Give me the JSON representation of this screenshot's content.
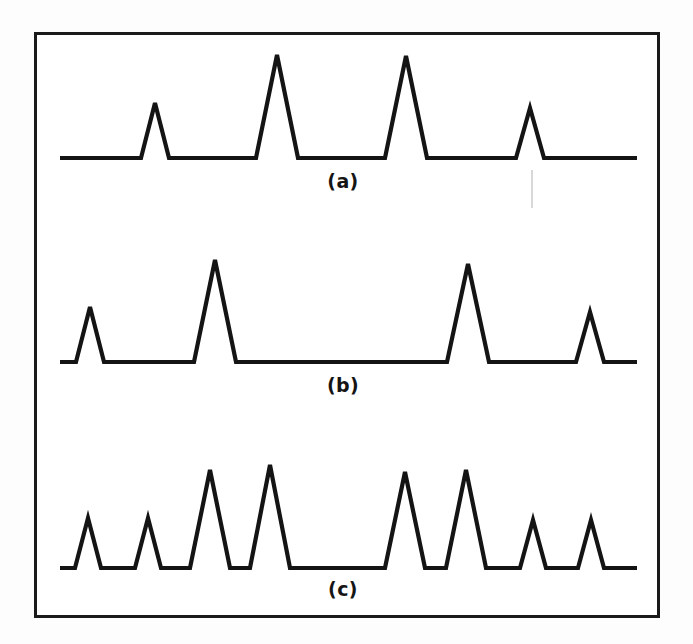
{
  "figure": {
    "title": "",
    "frame": {
      "x": 34,
      "y": 32,
      "width": 626,
      "height": 586,
      "border_color": "#1a1a1a",
      "border_width": 3
    },
    "background_color": "#ffffff",
    "stroke_color": "#141414",
    "stroke_width": 4.2
  },
  "chart_data": {
    "type": "line",
    "title": "",
    "subtitle": "",
    "xlabel": "",
    "ylabel": "",
    "grid": false,
    "legend_position": "none",
    "axes_visible": false,
    "xlim": [
      60,
      637
    ],
    "panels": [
      {
        "id": "a",
        "label": "(a)",
        "label_x": 343,
        "label_y": 170,
        "baseline_y": 158,
        "x_start": 60,
        "x_end": 637,
        "peaks": [
          {
            "index": 1,
            "center": 155,
            "apex_y": 103,
            "half_width": 14,
            "height": 55,
            "relative_height": 0.53
          },
          {
            "index": 2,
            "center": 277,
            "apex_y": 55,
            "half_width": 21,
            "height": 103,
            "relative_height": 1.0
          },
          {
            "index": 3,
            "center": 406,
            "apex_y": 56,
            "half_width": 21,
            "height": 102,
            "relative_height": 0.99
          },
          {
            "index": 4,
            "center": 530,
            "apex_y": 108,
            "half_width": 14,
            "height": 50,
            "relative_height": 0.49
          }
        ]
      },
      {
        "id": "b",
        "label": "(b)",
        "label_x": 343,
        "label_y": 374,
        "baseline_y": 362,
        "x_start": 60,
        "x_end": 637,
        "peaks": [
          {
            "index": 1,
            "center": 90,
            "apex_y": 307,
            "half_width": 14,
            "height": 55,
            "relative_height": 0.54
          },
          {
            "index": 2,
            "center": 215,
            "apex_y": 260,
            "half_width": 21,
            "height": 102,
            "relative_height": 1.0
          },
          {
            "index": 3,
            "center": 468,
            "apex_y": 264,
            "half_width": 21,
            "height": 98,
            "relative_height": 0.96
          },
          {
            "index": 4,
            "center": 590,
            "apex_y": 312,
            "half_width": 14,
            "height": 50,
            "relative_height": 0.49
          }
        ]
      },
      {
        "id": "c",
        "label": "(c)",
        "label_x": 343,
        "label_y": 578,
        "baseline_y": 568,
        "x_start": 60,
        "x_end": 637,
        "peaks": [
          {
            "index": 1,
            "center": 88,
            "apex_y": 518,
            "half_width": 13,
            "height": 50,
            "relative_height": 0.49
          },
          {
            "index": 2,
            "center": 148,
            "apex_y": 518,
            "half_width": 13,
            "height": 50,
            "relative_height": 0.49
          },
          {
            "index": 3,
            "center": 210,
            "apex_y": 470,
            "half_width": 20,
            "height": 98,
            "relative_height": 0.96
          },
          {
            "index": 4,
            "center": 270,
            "apex_y": 465,
            "half_width": 20,
            "height": 103,
            "relative_height": 1.0
          },
          {
            "index": 5,
            "center": 405,
            "apex_y": 472,
            "half_width": 20,
            "height": 96,
            "relative_height": 0.93
          },
          {
            "index": 6,
            "center": 466,
            "apex_y": 470,
            "half_width": 20,
            "height": 98,
            "relative_height": 0.96
          },
          {
            "index": 7,
            "center": 533,
            "apex_y": 520,
            "half_width": 13,
            "height": 48,
            "relative_height": 0.47
          },
          {
            "index": 8,
            "center": 591,
            "apex_y": 520,
            "half_width": 13,
            "height": 48,
            "relative_height": 0.47
          }
        ]
      }
    ]
  },
  "labels": {
    "panel_a": "(a)",
    "panel_b": "(b)",
    "panel_c": "(c)"
  },
  "artifacts": [
    {
      "name": "scan-speck",
      "x": 531,
      "y": 170,
      "width": 2,
      "height": 38
    }
  ]
}
